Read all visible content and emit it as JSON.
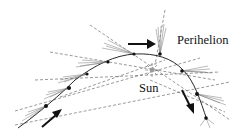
{
  "labels": {
    "perihelion": "Perihelion",
    "sun": "Sun"
  },
  "colors": {
    "ink": "#111111",
    "tail": "#777777",
    "dashed": "#555555",
    "background": "#ffffff"
  },
  "comet_positions": 8,
  "arrows": [
    "incoming-direction",
    "perihelion-pointer",
    "outgoing-direction"
  ]
}
